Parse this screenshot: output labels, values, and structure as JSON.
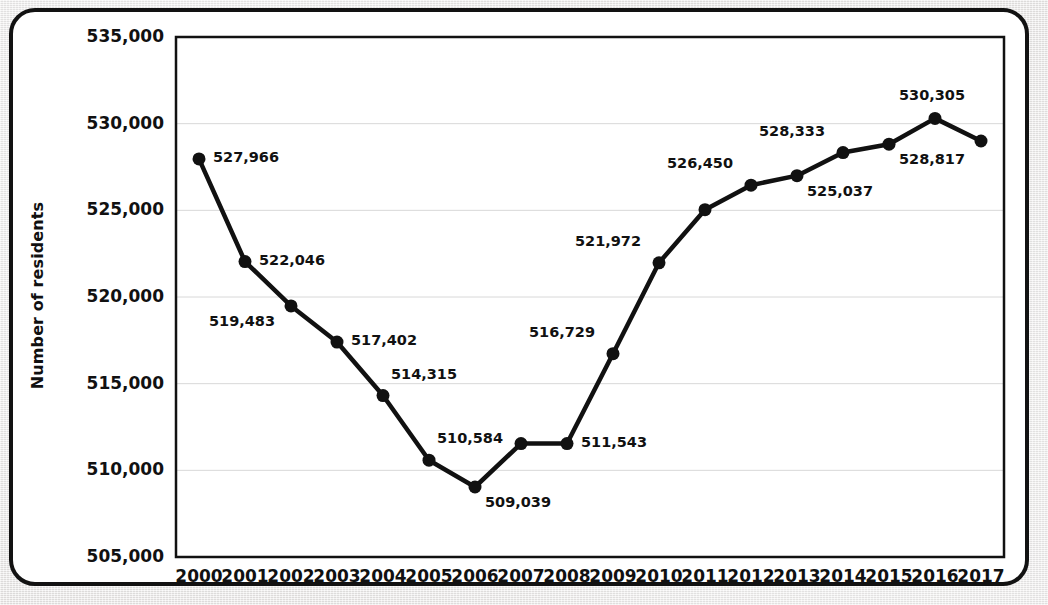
{
  "chart_data": {
    "type": "line",
    "title": "",
    "xlabel": "",
    "ylabel": "Number of residents",
    "categories": [
      "2000",
      "2001",
      "2002",
      "2003",
      "2004",
      "2005",
      "2006",
      "2007",
      "2008",
      "2009",
      "2010",
      "2011",
      "2012",
      "2013",
      "2014",
      "2015",
      "2016",
      "2017"
    ],
    "values": [
      527966,
      522046,
      519483,
      517402,
      514315,
      510584,
      509039,
      511543,
      516729,
      521972,
      525037,
      526450,
      528333,
      528817,
      530305,
      529000,
      525037,
      529000
    ],
    "series": [
      {
        "name": "Number of residents",
        "points": [
          {
            "x": "2000",
            "y": 527966,
            "label": "527,966",
            "label_pos": "right"
          },
          {
            "x": "2001",
            "y": 522046,
            "label": "522,046",
            "label_pos": "right"
          },
          {
            "x": "2002",
            "y": 519483,
            "label": "519,483",
            "label_pos": "below-left"
          },
          {
            "x": "2003",
            "y": 517402,
            "label": "517,402",
            "label_pos": "right"
          },
          {
            "x": "2004",
            "y": 514315,
            "label": "514,315",
            "label_pos": "above-right"
          },
          {
            "x": "2005",
            "y": 510584,
            "label": "510,584",
            "label_pos": "above-right"
          },
          {
            "x": "2006",
            "y": 509039,
            "label": "509,039",
            "label_pos": "below-right"
          },
          {
            "x": "2007",
            "y": 511543,
            "label": "",
            "label_pos": "none"
          },
          {
            "x": "2008",
            "y": 511543,
            "label": "511,543",
            "label_pos": "right"
          },
          {
            "x": "2009",
            "y": 516729,
            "label": "516,729",
            "label_pos": "above-left"
          },
          {
            "x": "2010",
            "y": 521972,
            "label": "521,972",
            "label_pos": "above-left"
          },
          {
            "x": "2011",
            "y": 525037,
            "label": "",
            "label_pos": "none"
          },
          {
            "x": "2012",
            "y": 526450,
            "label": "526,450",
            "label_pos": "above-left"
          },
          {
            "x": "2013",
            "y": 527000,
            "label": "525,037",
            "label_pos": "below-right"
          },
          {
            "x": "2014",
            "y": 528333,
            "label": "528,333",
            "label_pos": "above-left"
          },
          {
            "x": "2015",
            "y": 528817,
            "label": "528,817",
            "label_pos": "below-right"
          },
          {
            "x": "2016",
            "y": 530305,
            "label": "530,305",
            "label_pos": "above"
          },
          {
            "x": "2017",
            "y": 529000,
            "label": "",
            "label_pos": "none"
          }
        ]
      }
    ],
    "value_labels": [
      "527,966",
      "522,046",
      "519,483",
      "517,402",
      "514,315",
      "510,584",
      "509,039",
      "511,543",
      "516,729",
      "521,972",
      "526,450",
      "525,037",
      "528,333",
      "528,817",
      "530,305"
    ],
    "y_ticks": [
      "505,000",
      "510,000",
      "515,000",
      "520,000",
      "525,000",
      "530,000",
      "535,000"
    ],
    "y_tick_values": [
      505000,
      510000,
      515000,
      520000,
      525000,
      530000,
      535000
    ],
    "ylim": [
      505000,
      535000
    ],
    "grid": "horizontal",
    "legend": "none",
    "line_color": "#111111",
    "marker_color": "#111111",
    "grid_color": "#d8d8d8",
    "axis_color": "#111111",
    "background_color": "#ffffff"
  }
}
